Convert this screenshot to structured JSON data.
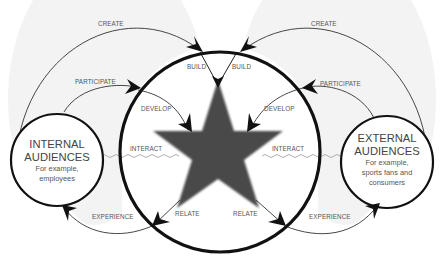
{
  "diagram": {
    "type": "stakeholder engagement cycle",
    "colors": {
      "background": "#ffffff",
      "shaded_region": "#f3f3f3",
      "star_fill": "#4a4a4a",
      "main_circle_stroke": "#111111",
      "arc_stroke": "#333333",
      "wave_stroke": "#999999",
      "text": "#555555"
    },
    "center": {
      "shape": "star",
      "description": "Dark grey five-pointed star in the middle of a large circle"
    },
    "internal_audiences": {
      "title_line1": "INTERNAL",
      "title_line2": "AUDIENCES",
      "sub_line1": "For example,",
      "sub_line2": "employees"
    },
    "external_audiences": {
      "title_line1": "EXTERNAL",
      "title_line2": "AUDIENCES",
      "sub_line1": "For example,",
      "sub_line2": "sports fans and",
      "sub_line3": "consumers"
    },
    "labels": {
      "create_left": "CREATE",
      "create_right": "CREATE",
      "participate_left": "PARTICIPATE",
      "participate_right": "PARTICIPATE",
      "build_left": "BUILD",
      "build_right": "BUILD",
      "develop_left": "DEVELOP",
      "develop_right": "DEVELOP",
      "interact_left": "INTERACT",
      "interact_right": "INTERACT",
      "relate_left": "RELATE",
      "relate_right": "RELATE",
      "experience_left": "EXPERIENCE",
      "experience_right": "EXPERIENCE"
    }
  }
}
